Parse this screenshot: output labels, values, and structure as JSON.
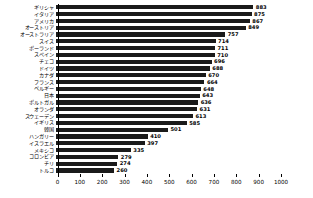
{
  "chart_data": {
    "type": "bar",
    "orientation": "horizontal",
    "title": "",
    "subtitle": "",
    "xlabel": "",
    "ylabel": "",
    "xlim": [
      0,
      1000
    ],
    "grid": false,
    "legend": null,
    "value_labels": true,
    "bar_color": "#1a1a1a",
    "axis_color": "#000000",
    "background": "#ffffff",
    "xticks": [
      0,
      100,
      200,
      300,
      400,
      500,
      600,
      700,
      800,
      900,
      1000
    ],
    "xtick_labels": [
      "0",
      "100",
      "200",
      "300",
      "400",
      "500",
      "600",
      "700",
      "800",
      "900",
      "1000"
    ],
    "categories": [
      "ギリシャ",
      "イタリア",
      "アメリカ",
      "オーストリア",
      "オーストラリア",
      "スイス",
      "ポーランド",
      "スペイン",
      "チェコ",
      "ドイツ",
      "カナダ",
      "フランス",
      "ベルギー",
      "日本",
      "ポルトガル",
      "オランダ",
      "スウェーデン",
      "イギリス",
      "韓国",
      "ハンガリー",
      "イスラエル",
      "メキシコ",
      "コロンビア",
      "チリ",
      "トルコ"
    ],
    "values": [
      883,
      875,
      867,
      849,
      757,
      714,
      711,
      710,
      696,
      688,
      670,
      664,
      648,
      643,
      636,
      631,
      613,
      585,
      501,
      410,
      397,
      335,
      279,
      274,
      260
    ],
    "value_label_texts": [
      "883",
      "875",
      "867",
      "849",
      "757",
      "714",
      "711",
      "710",
      "696",
      "688",
      "670",
      "664",
      "648",
      "643",
      "636",
      "631",
      "613",
      "585",
      "501",
      "410",
      "397",
      "335",
      "279",
      "274",
      "260"
    ]
  }
}
